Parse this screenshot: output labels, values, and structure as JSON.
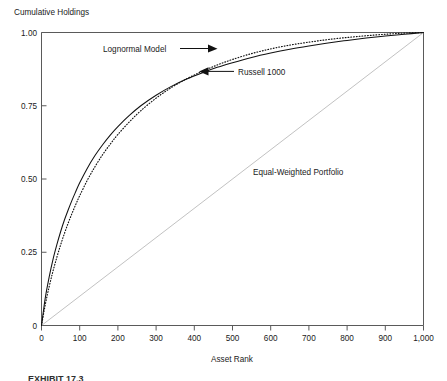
{
  "chart_data": {
    "type": "line",
    "title": "",
    "ylabel": "Cumulative Holdings",
    "xlabel": "Asset Rank",
    "xlim": [
      0,
      1000
    ],
    "ylim": [
      0,
      1.0
    ],
    "grid": false,
    "legend_position": "inline-annotations",
    "xticks": [
      0,
      100,
      200,
      300,
      400,
      500,
      600,
      700,
      800,
      900,
      1000
    ],
    "xticklabels": [
      "0",
      "100",
      "200",
      "300",
      "400",
      "500",
      "600",
      "700",
      "800",
      "900",
      "1,000"
    ],
    "yticks": [
      0,
      0.25,
      0.5,
      0.75,
      1.0
    ],
    "yticklabels": [
      "0",
      "0.25",
      "0.50",
      "0.75",
      "1.00"
    ],
    "series": [
      {
        "name": "Russell 1000",
        "style": "solid",
        "color": "#111111",
        "x": [
          0,
          10,
          20,
          30,
          40,
          50,
          60,
          70,
          80,
          90,
          100,
          120,
          140,
          160,
          180,
          200,
          230,
          260,
          300,
          340,
          380,
          420,
          460,
          500,
          550,
          600,
          650,
          700,
          750,
          800,
          850,
          900,
          950,
          1000
        ],
        "y": [
          0.0,
          0.095,
          0.165,
          0.225,
          0.275,
          0.32,
          0.36,
          0.395,
          0.428,
          0.458,
          0.487,
          0.537,
          0.58,
          0.617,
          0.65,
          0.679,
          0.717,
          0.75,
          0.786,
          0.816,
          0.841,
          0.862,
          0.881,
          0.897,
          0.915,
          0.93,
          0.943,
          0.954,
          0.964,
          0.973,
          0.981,
          0.988,
          0.994,
          1.0
        ]
      },
      {
        "name": "Lognormal Model",
        "style": "dotted",
        "color": "#111111",
        "x": [
          0,
          10,
          20,
          30,
          40,
          50,
          60,
          70,
          80,
          90,
          100,
          120,
          140,
          160,
          180,
          200,
          230,
          260,
          300,
          340,
          380,
          420,
          460,
          500,
          550,
          600,
          650,
          700,
          750,
          800,
          850,
          900,
          950,
          1000
        ],
        "y": [
          0.0,
          0.072,
          0.132,
          0.185,
          0.232,
          0.275,
          0.314,
          0.35,
          0.383,
          0.414,
          0.443,
          0.496,
          0.542,
          0.583,
          0.619,
          0.652,
          0.695,
          0.733,
          0.776,
          0.812,
          0.842,
          0.867,
          0.889,
          0.908,
          0.928,
          0.944,
          0.957,
          0.967,
          0.976,
          0.983,
          0.989,
          0.994,
          0.998,
          1.0
        ]
      },
      {
        "name": "Equal-Weighted Portfolio",
        "style": "solid-light",
        "color": "#c2c2c2",
        "x": [
          0,
          1000
        ],
        "y": [
          0.0,
          1.0
        ]
      }
    ],
    "annotations": [
      {
        "text": "Lognormal Model",
        "target": "Lognormal Model",
        "arrow": "right"
      },
      {
        "text": "Russell 1000",
        "target": "Russell 1000",
        "arrow": "left"
      },
      {
        "text": "Equal-Weighted Portfolio",
        "target": "Equal-Weighted Portfolio",
        "arrow": "none"
      }
    ]
  },
  "figure": {
    "ylabel": "Cumulative Holdings",
    "xlabel": "Asset Rank",
    "annotation_lognormal": "Lognormal Model",
    "annotation_russell": "Russell 1000",
    "annotation_equal_weighted": "Equal-Weighted Portfolio",
    "caption": "EXHIBIT 17.3"
  }
}
